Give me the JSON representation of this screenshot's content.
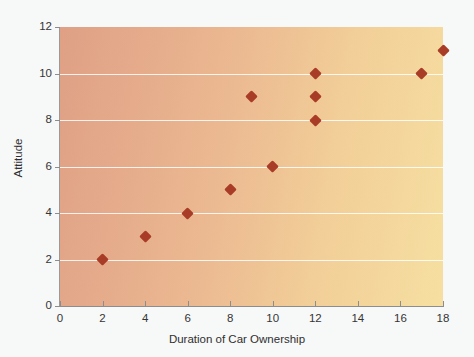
{
  "chart_data": {
    "type": "scatter",
    "title": "",
    "xlabel": "Duration of Car Ownership",
    "ylabel": "Attitude",
    "xlim": [
      0,
      18
    ],
    "ylim": [
      0,
      12
    ],
    "xticks": [
      0,
      2,
      4,
      6,
      8,
      10,
      12,
      14,
      16,
      18
    ],
    "yticks": [
      0,
      2,
      4,
      6,
      8,
      10,
      12
    ],
    "grid": "horizontal",
    "legend": null,
    "marker": "diamond",
    "marker_color": "#a93c27",
    "points": [
      {
        "x": 2,
        "y": 2
      },
      {
        "x": 4,
        "y": 3
      },
      {
        "x": 6,
        "y": 4
      },
      {
        "x": 8,
        "y": 5
      },
      {
        "x": 9,
        "y": 9
      },
      {
        "x": 10,
        "y": 6
      },
      {
        "x": 12,
        "y": 8
      },
      {
        "x": 12,
        "y": 9
      },
      {
        "x": 12,
        "y": 10
      },
      {
        "x": 17,
        "y": 10
      },
      {
        "x": 18,
        "y": 11
      }
    ]
  },
  "colors": {
    "page_background": "#f7f8f8",
    "plot_gradient_start": "#dfa085",
    "plot_gradient_end": "#f6dfa1",
    "gridline": "#ffffff",
    "axis": "#8d8d8d",
    "marker": "#a93c27",
    "tick_label": "#353535",
    "axis_title": "#2f2f2f"
  }
}
